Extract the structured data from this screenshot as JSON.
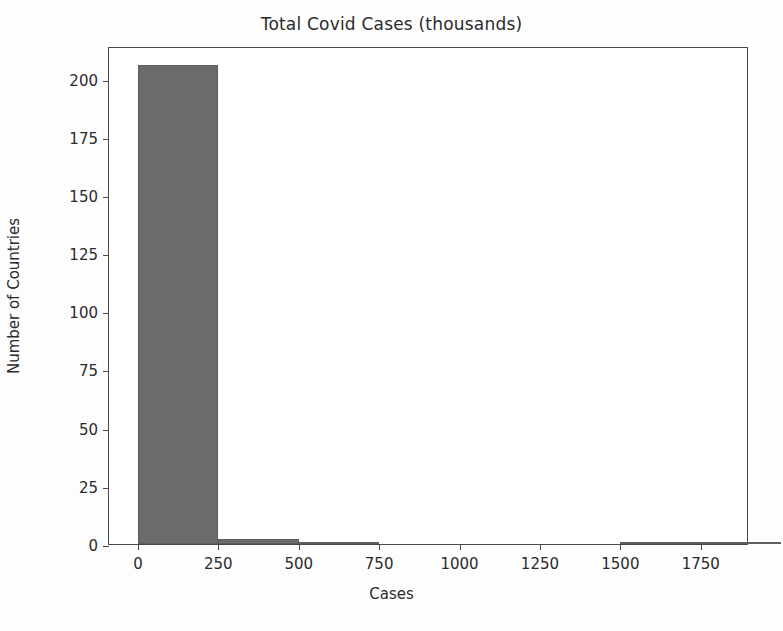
{
  "chart_data": {
    "type": "bar",
    "title": "Total Covid Cases (thousands)",
    "xlabel": "Cases",
    "ylabel": "Number of Countries",
    "xlim": [
      -90,
      1900
    ],
    "ylim": [
      0,
      214
    ],
    "grid": false,
    "legend": null,
    "bar_color": "#6b6b6b",
    "background_color": "#ffffff",
    "frame_color": "#4a4a4a",
    "xticks": [
      0,
      250,
      500,
      750,
      1000,
      1250,
      1500,
      1750
    ],
    "xtick_labels": [
      "0",
      "250",
      "500",
      "750",
      "1000",
      "1250",
      "1500",
      "1750"
    ],
    "yticks": [
      0,
      25,
      50,
      75,
      100,
      125,
      150,
      175,
      200
    ],
    "ytick_labels": [
      "0",
      "25",
      "50",
      "75",
      "100",
      "125",
      "150",
      "175",
      "200"
    ],
    "bin_edges": [
      0,
      250,
      500,
      750,
      1000,
      1250,
      1500,
      1750,
      2000
    ],
    "categories": [
      "0-250",
      "250-500",
      "500-750",
      "750-1000",
      "1000-1250",
      "1250-1500",
      "1500-1750",
      "1750-2000"
    ],
    "values": [
      206,
      2,
      1,
      0,
      0,
      0,
      1,
      1
    ],
    "bars": [
      {
        "label": "0-250",
        "x0": 0,
        "x1": 250,
        "value": 206
      },
      {
        "label": "250-500",
        "x0": 250,
        "x1": 500,
        "value": 2
      },
      {
        "label": "500-750",
        "x0": 500,
        "x1": 750,
        "value": 1
      },
      {
        "label": "750-1000",
        "x0": 750,
        "x1": 1000,
        "value": 0
      },
      {
        "label": "1000-1250",
        "x0": 1000,
        "x1": 1250,
        "value": 0
      },
      {
        "label": "1250-1500",
        "x0": 1250,
        "x1": 1500,
        "value": 0
      },
      {
        "label": "1500-1750",
        "x0": 1500,
        "x1": 1750,
        "value": 1
      },
      {
        "label": "1750-2000",
        "x0": 1750,
        "x1": 2000,
        "value": 1
      }
    ]
  }
}
